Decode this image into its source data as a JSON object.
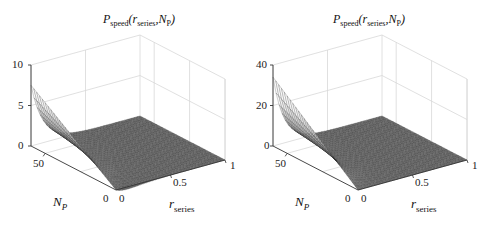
{
  "chart_data": [
    {
      "type": "surface3d",
      "title": "P_speed(r_series, N_P)",
      "title_parts": {
        "main": "P",
        "sub": "speed",
        "args_open": "(",
        "arg1": "r",
        "arg1_sub": "series",
        "sep": ",",
        "arg2": "N",
        "arg2_sub": "P",
        "args_close": ")"
      },
      "xlabel": "r_series",
      "ylabel": "N_P",
      "zlabel": "",
      "xlim": [
        0,
        1
      ],
      "ylim": [
        0,
        60
      ],
      "zlim": [
        0,
        10
      ],
      "xticks": [
        "0",
        "0.5",
        "1"
      ],
      "yticks": [
        "0",
        "50"
      ],
      "zticks": [
        "0",
        "5",
        "10"
      ],
      "grid": true,
      "description": "Surface peaks near r_series=0 at high N_P (about 7.5), decays quickly to ~0 with increasing r_series; dips slightly below 0 near r_series≈0.1 at low N_P",
      "sample_surface": {
        "r_series": [
          0,
          0.1,
          0.2,
          0.4,
          0.6,
          0.8,
          1.0
        ],
        "N_P": [
          0,
          20,
          40,
          60
        ],
        "values": [
          [
            0.0,
            -1.5,
            -0.8,
            -0.3,
            -0.1,
            0.0,
            0.0
          ],
          [
            2.5,
            0.8,
            0.2,
            0.05,
            0.0,
            0.0,
            0.0
          ],
          [
            5.0,
            2.0,
            0.6,
            0.1,
            0.0,
            0.0,
            0.0
          ],
          [
            7.5,
            3.0,
            1.0,
            0.2,
            0.05,
            0.0,
            0.0
          ]
        ]
      }
    },
    {
      "type": "surface3d",
      "title": "P_speed(r_series, N_P)",
      "title_parts": {
        "main": "P",
        "sub": "speed",
        "args_open": "(",
        "arg1": "r",
        "arg1_sub": "series",
        "sep": ",",
        "arg2": "N",
        "arg2_sub": "P",
        "args_close": ")"
      },
      "xlabel": "r_series",
      "ylabel": "N_P",
      "zlabel": "",
      "xlim": [
        0,
        1
      ],
      "ylim": [
        0,
        60
      ],
      "zlim": [
        0,
        40
      ],
      "xticks": [
        "0",
        "0.5",
        "1"
      ],
      "yticks": [
        "0",
        "50"
      ],
      "zticks": [
        "0",
        "20",
        "40"
      ],
      "grid": true,
      "description": "Surface peaks near r_series=0 at high N_P (about 34), decays quickly to ~0 with increasing r_series, flat near 0 elsewhere",
      "sample_surface": {
        "r_series": [
          0,
          0.1,
          0.2,
          0.4,
          0.6,
          0.8,
          1.0
        ],
        "N_P": [
          0,
          20,
          40,
          60
        ],
        "values": [
          [
            0.0,
            0.0,
            0.0,
            0.0,
            0.0,
            0.0,
            0.0
          ],
          [
            8.0,
            3.0,
            0.8,
            0.1,
            0.0,
            0.0,
            0.0
          ],
          [
            20.0,
            8.0,
            2.0,
            0.3,
            0.0,
            0.0,
            0.0
          ],
          [
            34.0,
            14.0,
            4.0,
            0.5,
            0.1,
            0.0,
            0.0
          ]
        ]
      }
    }
  ],
  "panels": [
    {
      "zticks": [
        "10",
        "5",
        "0"
      ],
      "yticks": [
        "50",
        "0"
      ],
      "xticks": [
        "0",
        "0.5",
        "1"
      ]
    },
    {
      "zticks": [
        "40",
        "20",
        "0"
      ],
      "yticks": [
        "50",
        "0"
      ],
      "xticks": [
        "0",
        "0.5",
        "1"
      ]
    }
  ],
  "labels": {
    "title_P": "P",
    "title_speed": "speed",
    "title_open": "(",
    "title_r": "r",
    "title_series": "series",
    "title_comma": ",",
    "title_N": "N",
    "title_Psub": "P",
    "title_close": ")",
    "np_N": "N",
    "np_P": "P",
    "r_r": "r",
    "r_series": "series"
  },
  "colors": {
    "axis": "#333333",
    "grid": "#d8d8d8",
    "mesh": "#222222"
  }
}
